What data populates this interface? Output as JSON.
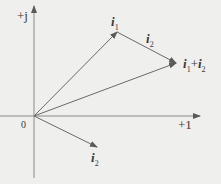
{
  "diagram": {
    "type": "phasor-diagram",
    "axes": {
      "vertical_label": "+j",
      "horizontal_label": "+1",
      "origin_label": "0"
    },
    "vectors": [
      {
        "name": "i1",
        "label": "i",
        "sub": "1",
        "from": [
          34,
          116
        ],
        "to": [
          117,
          32
        ]
      },
      {
        "name": "i2",
        "label": "i",
        "sub": "2",
        "from": [
          34,
          116
        ],
        "to": [
          97,
          147
        ]
      },
      {
        "name": "i2-translated",
        "label": "i",
        "sub": "2",
        "from": [
          117,
          32
        ],
        "to": [
          176,
          63
        ]
      },
      {
        "name": "sum",
        "label": "i",
        "sub": "1",
        "label2": "i",
        "sub2": "2",
        "plus": "+",
        "from": [
          34,
          116
        ],
        "to": [
          176,
          63
        ]
      }
    ],
    "colors": {
      "line": "#7a7a7a",
      "text": "#3a3a3a",
      "background": "#efefed"
    }
  }
}
